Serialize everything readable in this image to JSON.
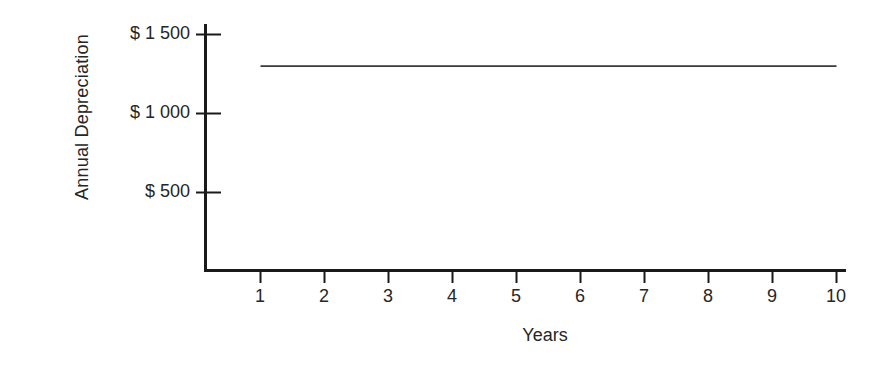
{
  "chart_data": {
    "type": "line",
    "title": "",
    "xlabel": "Years",
    "ylabel": "Annual Depreciation",
    "x": [
      1,
      2,
      3,
      4,
      5,
      6,
      7,
      8,
      9,
      10
    ],
    "values": [
      1300,
      1300,
      1300,
      1300,
      1300,
      1300,
      1300,
      1300,
      1300,
      1300
    ],
    "series": [
      {
        "name": "Annual Depreciation",
        "values": [
          1300,
          1300,
          1300,
          1300,
          1300,
          1300,
          1300,
          1300,
          1300,
          1300
        ]
      }
    ],
    "xticks": [
      "1",
      "2",
      "3",
      "4",
      "5",
      "6",
      "7",
      "8",
      "9",
      "10"
    ],
    "yticks": [
      "$ 500",
      "$ 1 000",
      "$ 1 500"
    ],
    "ytick_values": [
      500,
      1000,
      1500
    ],
    "xlim": [
      0,
      10.5
    ],
    "ylim": [
      0,
      1620
    ],
    "grid": false,
    "legend": false,
    "line_color": "#3a3a3a"
  },
  "axes": {
    "y_title": "Annual Depreciation",
    "x_title": "Years",
    "y_tick_labels": [
      {
        "text": "$ 1 500",
        "top": 23
      },
      {
        "text": "$ 1 000",
        "top": 102
      },
      {
        "text": "$ 500",
        "top": 181
      }
    ],
    "x_tick_labels": [
      {
        "text": "1",
        "left": 240
      },
      {
        "text": "2",
        "left": 304
      },
      {
        "text": "3",
        "left": 368
      },
      {
        "text": "4",
        "left": 432
      },
      {
        "text": "5",
        "left": 496
      },
      {
        "text": "6",
        "left": 560
      },
      {
        "text": "7",
        "left": 624
      },
      {
        "text": "8",
        "left": 688
      },
      {
        "text": "9",
        "left": 752
      },
      {
        "text": "10",
        "left": 816
      }
    ]
  },
  "colors": {
    "background": "#ffffff",
    "axis": "#1a1a1a",
    "text": "#262626",
    "data_line": "#3a3a3a"
  }
}
